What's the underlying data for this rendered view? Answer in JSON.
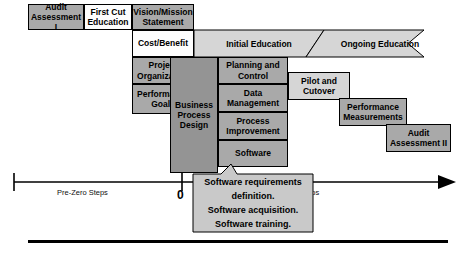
{
  "diagram": {
    "colors": {
      "gray": "#a9a9a9",
      "dark_gray": "#949494",
      "light_gray": "#d6d6d6",
      "white": "#fdfdfd",
      "line": "#000000"
    },
    "boxes": [
      {
        "id": "audit-assessment-1",
        "label": "Audit\nAssessment I",
        "shade": "gray"
      },
      {
        "id": "first-cut-education",
        "label": "First Cut\nEducation",
        "shade": "white"
      },
      {
        "id": "vision-mission",
        "label": "Vision/Mission\nStatement",
        "shade": "gray"
      },
      {
        "id": "cost-benefit",
        "label": "Cost/Benefit",
        "shade": "white"
      },
      {
        "id": "project-organization",
        "label": "Project\nOrganization",
        "shade": "gray"
      },
      {
        "id": "performance-goals",
        "label": "Performance\nGoals",
        "shade": "gray"
      },
      {
        "id": "business-process-design",
        "label": "Business\nProcess\nDesign",
        "shade": "dark"
      },
      {
        "id": "planning-and-control",
        "label": "Planning and\nControl",
        "shade": "gray"
      },
      {
        "id": "data-management",
        "label": "Data\nManagement",
        "shade": "gray"
      },
      {
        "id": "process-improvement",
        "label": "Process\nImprovement",
        "shade": "gray"
      },
      {
        "id": "software",
        "label": "Software",
        "shade": "gray"
      },
      {
        "id": "pilot-and-cutover",
        "label": "Pilot and\nCutover",
        "shade": "light"
      },
      {
        "id": "performance-measurements",
        "label": "Performance\nMeasurements",
        "shade": "gray"
      },
      {
        "id": "audit-assessment-2",
        "label": "Audit\nAssessment II",
        "shade": "gray"
      }
    ],
    "bands": [
      {
        "id": "initial-education",
        "label": "Initial Education",
        "shade": "light"
      },
      {
        "id": "ongoing-education",
        "label": "Ongoing Education",
        "shade": "light"
      }
    ],
    "callout": {
      "lines": [
        "Software requirements definition.",
        "Software acquisition.",
        "Software training."
      ],
      "line1a": "Software requirements",
      "line1b": "definition.",
      "line2": "Software acquisition.",
      "line3": "Software training."
    },
    "timeline": {
      "left_label": "Pre-Zero Steps",
      "zero_label": "0",
      "right_label": "teps"
    }
  }
}
